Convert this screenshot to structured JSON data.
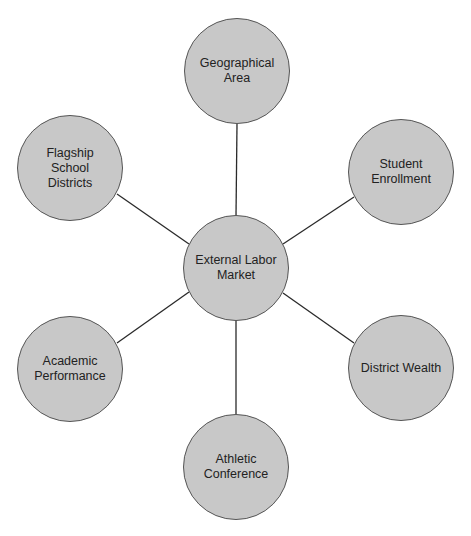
{
  "diagram": {
    "type": "hub-and-spoke",
    "colors": {
      "node_fill": "#c8c8c8",
      "node_border": "#555555",
      "edge": "#2a2a2a",
      "text": "#222222",
      "background": "#ffffff"
    },
    "hub": {
      "id": "external-labor-market",
      "label": "External Labor\nMarket",
      "cx": 236,
      "cy": 268
    },
    "nodes": [
      {
        "id": "geographical-area",
        "label": "Geographical\nArea",
        "cx": 237,
        "cy": 71
      },
      {
        "id": "student-enrollment",
        "label": "Student\nEnrollment",
        "cx": 401,
        "cy": 172
      },
      {
        "id": "district-wealth",
        "label": "District Wealth",
        "cx": 401,
        "cy": 368
      },
      {
        "id": "athletic-conference",
        "label": "Athletic\nConference",
        "cx": 236,
        "cy": 467
      },
      {
        "id": "academic-performance",
        "label": "Academic\nPerformance",
        "cx": 70,
        "cy": 369
      },
      {
        "id": "flagship-school-districts",
        "label": "Flagship\nSchool\nDistricts",
        "cx": 70,
        "cy": 168
      }
    ],
    "edges": [
      {
        "from": "external-labor-market",
        "to": "geographical-area"
      },
      {
        "from": "external-labor-market",
        "to": "student-enrollment"
      },
      {
        "from": "external-labor-market",
        "to": "district-wealth"
      },
      {
        "from": "external-labor-market",
        "to": "athletic-conference"
      },
      {
        "from": "external-labor-market",
        "to": "academic-performance"
      },
      {
        "from": "external-labor-market",
        "to": "flagship-school-districts"
      }
    ]
  }
}
